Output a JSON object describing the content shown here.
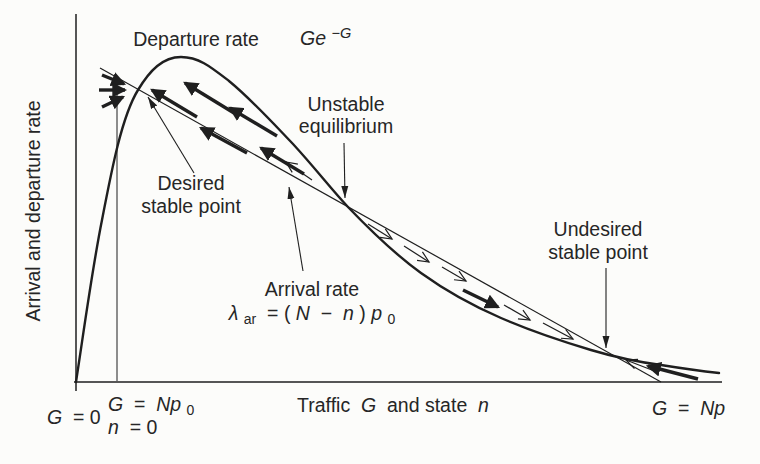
{
  "colors": {
    "ink": "#1f1f1f",
    "background": "#fcfcfa"
  },
  "axes": {
    "y_label": "Arrival and departure rate",
    "x_label": {
      "pre": "Traffic ",
      "g": "G",
      "mid": " and state ",
      "n": "n"
    }
  },
  "curves": {
    "departure": {
      "label": "Departure rate",
      "formula_base": "Ge",
      "formula_sup": "−G"
    },
    "arrival": {
      "label": "Arrival rate",
      "f_lambda": "λ",
      "f_sub": "ar",
      "f_eq": " = (",
      "f_N": "N",
      "f_minus": " − ",
      "f_n": "n",
      "f_close": ")",
      "f_p": "p",
      "f_zero": "0"
    }
  },
  "annotations": {
    "desired": {
      "line1": "Desired",
      "line2": "stable point"
    },
    "unstable": {
      "line1": "Unstable",
      "line2": "equilibrium"
    },
    "undesired": {
      "line1": "Undesired",
      "line2": "stable point"
    }
  },
  "ticks": {
    "g0": {
      "g": "G",
      "rest": " = 0"
    },
    "gnp0": {
      "g": "G",
      "eq": " = ",
      "np": "Np",
      "zero": "0"
    },
    "n0": {
      "n": "n",
      "rest": " = 0"
    },
    "gnp": {
      "g": "G",
      "eq": " = ",
      "np": "Np"
    }
  }
}
